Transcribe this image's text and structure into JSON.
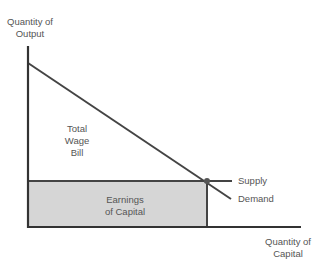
{
  "diagram": {
    "y_axis_label_line1": "Quantity of",
    "y_axis_label_line2": "Output",
    "x_axis_label_line1": "Quantity of",
    "x_axis_label_line2": "Capital",
    "region_upper_line1": "Total",
    "region_upper_line2": "Wage",
    "region_upper_line3": "Bill",
    "region_lower_line1": "Earnings",
    "region_lower_line2": "of Capital",
    "supply_label": "Supply",
    "demand_label": "Demand",
    "colors": {
      "axis": "#333333",
      "line": "#444444",
      "shaded": "#d6d6d6",
      "point": "#555555"
    }
  }
}
